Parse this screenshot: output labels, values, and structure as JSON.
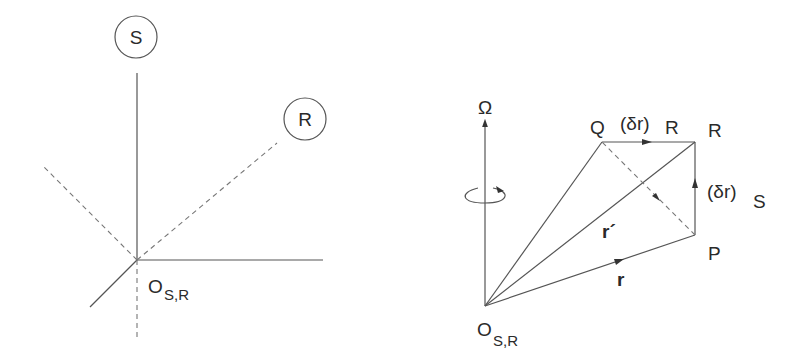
{
  "left_diagram": {
    "frame_labels": [
      "S",
      "R"
    ],
    "origin_label": "O",
    "origin_subscript": "S,R"
  },
  "right_diagram": {
    "axis_label": "Ω",
    "points": {
      "Q": "Q",
      "R": "R",
      "P": "P"
    },
    "origin_label": "O",
    "origin_subscript": "S,R",
    "delta_r_R": {
      "main": "(δr)",
      "sub": "R"
    },
    "delta_r_S": {
      "main": "(δr)",
      "sub": "S"
    },
    "vector_r": "r",
    "vector_r_prime": "r´"
  },
  "colors": {
    "line": "#555555",
    "dashed": "#777777",
    "text": "#2a2a2a"
  }
}
